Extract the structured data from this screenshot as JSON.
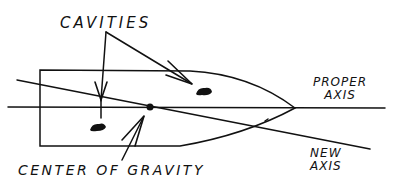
{
  "diagram": {
    "labels": {
      "cavities": "CAVITIES",
      "center_of_gravity": "CENTER OF GRAVITY",
      "proper_axis_line1": "PROPER",
      "proper_axis_line2": "AXIS",
      "new_axis_line1": "NEW",
      "new_axis_line2": "AXIS"
    },
    "nodes": [
      {
        "id": "body",
        "type": "bullet-shaped object outline"
      },
      {
        "id": "cavity-1",
        "type": "filled blob",
        "position": "lower-left inside body"
      },
      {
        "id": "cavity-2",
        "type": "filled blob",
        "position": "upper-right inside body"
      },
      {
        "id": "center-of-gravity",
        "type": "dot",
        "position": "on proper axis"
      }
    ],
    "edges": [
      {
        "from": "cavities-label",
        "to": "cavity-1",
        "type": "arrow"
      },
      {
        "from": "cavities-label",
        "to": "cavity-2",
        "type": "arrow"
      },
      {
        "from": "center-of-gravity-label",
        "to": "center-of-gravity",
        "type": "arrow"
      }
    ],
    "lines": [
      {
        "id": "proper-axis",
        "orientation": "horizontal"
      },
      {
        "id": "new-axis",
        "orientation": "tilted downward to right"
      }
    ],
    "colors": {
      "ink": "#111111",
      "background": "#ffffff"
    }
  }
}
